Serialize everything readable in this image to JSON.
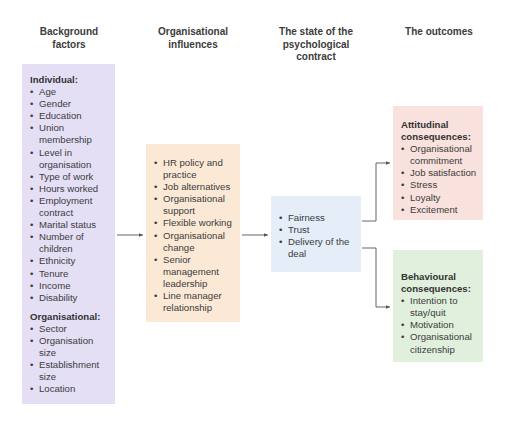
{
  "columns": [
    {
      "title": "Background factors"
    },
    {
      "title": "Organisational influences"
    },
    {
      "title": "The state of the psychological contract"
    },
    {
      "title": "The outcomes"
    }
  ],
  "background": {
    "individual_heading": "Individual:",
    "individual": [
      "Age",
      "Gender",
      "Education",
      "Union membership",
      "Level in organisation",
      "Type of work",
      "Hours worked",
      "Employment contract",
      "Marital status",
      "Number of children",
      "Ethnicity",
      "Tenure",
      "Income",
      "Disability"
    ],
    "organisational_heading": "Organisational:",
    "organisational": [
      "Sector",
      "Organisation size",
      "Establishment size",
      "Location"
    ]
  },
  "influences": [
    "HR policy and practice",
    "Job alternatives",
    "Organisational support",
    "Flexible working",
    "Organisational change",
    "Senior management leadership",
    "Line manager relationship"
  ],
  "state": [
    "Fairness",
    "Trust",
    "Delivery of the deal"
  ],
  "attitudinal": {
    "heading": "Attitudinal consequences:",
    "items": [
      "Organisational commitment",
      "Job satisfaction",
      "Stress",
      "Loyalty",
      "Excitement"
    ]
  },
  "behavioural": {
    "heading": "Behavioural consequences:",
    "items": [
      "Intention to stay/quit",
      "Motivation",
      "Organisational citizenship"
    ]
  },
  "colors": {
    "background_box": "#e4dff5",
    "influences_box": "#fbe9d6",
    "state_box": "#e4edf8",
    "attitudinal_box": "#f9e1dd",
    "behavioural_box": "#e0f0dc",
    "arrow": "#555555"
  }
}
